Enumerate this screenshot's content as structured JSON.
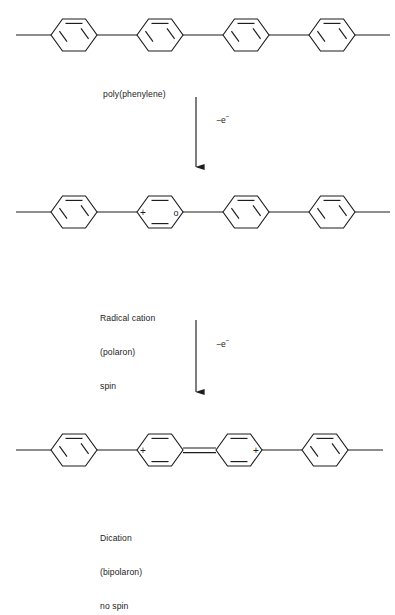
{
  "diagram": {
    "type": "chemical-reaction-scheme",
    "bond_color": "#1d1d1d",
    "background": "#ffffff"
  },
  "steps": [
    {
      "id": "neutral",
      "label": "poly(phenylene)",
      "species": "neutral polymer",
      "rings": [
        "aromatic",
        "aromatic",
        "aromatic",
        "aromatic"
      ],
      "charges": [],
      "spin": "none"
    },
    {
      "id": "polaron",
      "label_lines": [
        "Radical cation",
        "(polaron)",
        "spin"
      ],
      "species": "radical cation",
      "rings": [
        "aromatic",
        "quinoid",
        "aromatic",
        "aromatic"
      ],
      "charges": [
        "+"
      ],
      "radical_symbol": "o",
      "spin": "spin"
    },
    {
      "id": "bipolaron",
      "label_lines": [
        "Dication",
        "(bipolaron)",
        "no spin"
      ],
      "species": "dication",
      "rings": [
        "aromatic",
        "quinoid",
        "quinoid",
        "aromatic"
      ],
      "charges": [
        "+",
        "+"
      ],
      "spin": "no spin"
    }
  ],
  "arrows": [
    {
      "id": "arrow-1",
      "annotation": "−e",
      "annotation_superscript": "−"
    },
    {
      "id": "arrow-2",
      "annotation": "−e",
      "annotation_superscript": "−"
    }
  ],
  "labels": {
    "poly_phenylene": "poly(phenylene)",
    "radical_cation_l1": "Radical cation",
    "radical_cation_l2": "(polaron)",
    "radical_cation_l3": "spin",
    "dication_l1": "Dication",
    "dication_l2": "(bipolaron)",
    "dication_l3": "no spin",
    "minus_e": "−e",
    "minus_sup": "−",
    "plus_charge": "+",
    "radical_dot": "o"
  }
}
